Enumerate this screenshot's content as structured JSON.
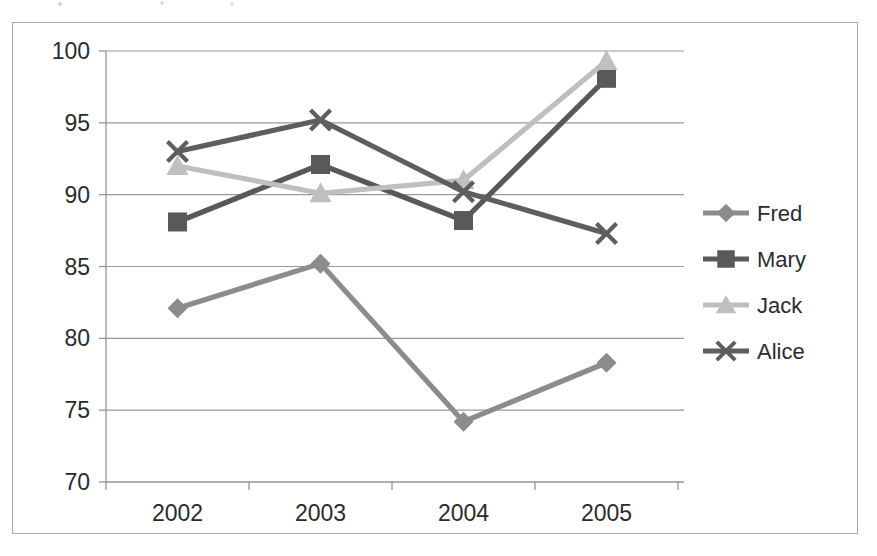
{
  "figure": {
    "frame_visible": true,
    "background": "#ffffff",
    "border_color": "#a9a9a9"
  },
  "chart_data": {
    "type": "line",
    "title": "",
    "subtitle": "",
    "xlabel": "",
    "ylabel": "",
    "categories": [
      "2002",
      "2003",
      "2004",
      "2005"
    ],
    "xtick_labels": [
      "2002",
      "2003",
      "2004",
      "2005"
    ],
    "ytick_labels": [
      "70",
      "75",
      "80",
      "85",
      "90",
      "95",
      "100"
    ],
    "ylim": [
      70,
      100
    ],
    "ytick_step": 5,
    "grid": "horizontal",
    "grid_color": "#9a9a9a",
    "legend_position": "right",
    "series": [
      {
        "name": "Fred",
        "marker": "diamond",
        "color": "#8c8c8c",
        "values": [
          82.1,
          85.2,
          74.2,
          78.3
        ]
      },
      {
        "name": "Mary",
        "marker": "square",
        "color": "#595959",
        "values": [
          88.1,
          92.1,
          88.2,
          98.1
        ]
      },
      {
        "name": "Jack",
        "marker": "triangle",
        "color": "#bfbfbf",
        "values": [
          92.0,
          90.1,
          91.0,
          99.3
        ]
      },
      {
        "name": "Alice",
        "marker": "x",
        "color": "#5e5e5e",
        "values": [
          93.0,
          95.2,
          90.2,
          87.3
        ]
      }
    ]
  },
  "legend": {
    "entries": [
      {
        "label": "Fred",
        "marker": "diamond",
        "color": "#8c8c8c"
      },
      {
        "label": "Mary",
        "marker": "square",
        "color": "#595959"
      },
      {
        "label": "Jack",
        "marker": "triangle",
        "color": "#bfbfbf"
      },
      {
        "label": "Alice",
        "marker": "x",
        "color": "#5e5e5e"
      }
    ]
  }
}
